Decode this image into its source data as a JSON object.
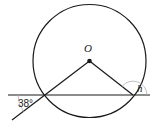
{
  "diagram": {
    "center_label": "O",
    "angle_given": "38°",
    "angle_unknown": "h",
    "colors": {
      "stroke": "#1a1a1a",
      "arc": "#b0b0b0",
      "background": "#ffffff"
    }
  }
}
